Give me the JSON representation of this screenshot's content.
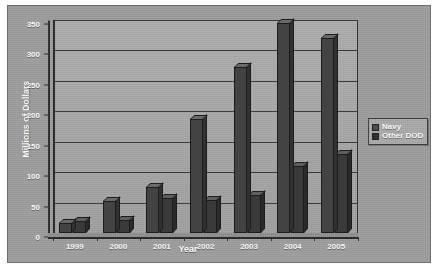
{
  "chart_data": {
    "type": "bar",
    "title": "",
    "xlabel": "Year",
    "ylabel": "Millions of Dollars",
    "categories": [
      "1999",
      "2000",
      "2001",
      "2002",
      "2003",
      "2004",
      "2005"
    ],
    "series": [
      {
        "name": "Navy",
        "values": [
          17,
          52,
          75,
          188,
          272,
          345,
          320
        ],
        "color": "#434343"
      },
      {
        "name": "Other DOD",
        "values": [
          20,
          22,
          57,
          55,
          63,
          110,
          130
        ],
        "color": "#3a3a3a"
      }
    ],
    "ylim": [
      0,
      350
    ],
    "yticks": [
      0,
      50,
      100,
      150,
      200,
      250,
      300,
      350
    ],
    "ytick_labels": [
      "0",
      "50",
      "100",
      "150",
      "200",
      "250",
      "300",
      "350"
    ],
    "grid": true,
    "legend_position": "right",
    "style": "3d-bar-grayscale"
  },
  "legend": {
    "entries": [
      {
        "label": "Navy"
      },
      {
        "label": "Other DOD"
      }
    ]
  },
  "colors": {
    "canvas_background": "#9d9d9d",
    "plot_background": "#a9a9a9",
    "gridline": "#33373a",
    "axis_text": "#ffffff",
    "navy_series": "#434343",
    "other_dod_series": "#3a3a3a"
  }
}
